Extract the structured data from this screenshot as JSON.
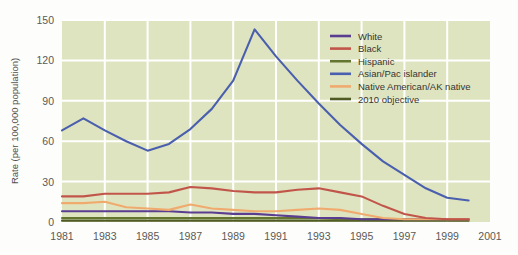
{
  "chart_data": {
    "type": "line",
    "title": "",
    "xlabel": "",
    "ylabel": "Rate (per 100,000 population)",
    "xlim": [
      1981,
      2001
    ],
    "ylim": [
      0,
      150
    ],
    "yticks": [
      0,
      30,
      60,
      90,
      120,
      150
    ],
    "ytick_labels": [
      "0",
      "30",
      "60",
      "90",
      "120",
      "150"
    ],
    "xticks": [
      1981,
      1983,
      1985,
      1987,
      1989,
      1991,
      1993,
      1995,
      1997,
      1999,
      2001
    ],
    "xtick_labels": [
      "1981",
      "1983",
      "1985",
      "1987",
      "1989",
      "1991",
      "1993",
      "1995",
      "1997",
      "1999",
      "2001"
    ],
    "grid": true,
    "grid_color": "#ffffff",
    "plot_bgcolor": "#dfe4c0",
    "legend_position": "upper right",
    "x": [
      1981,
      1982,
      1983,
      1984,
      1985,
      1986,
      1987,
      1988,
      1989,
      1990,
      1991,
      1992,
      1993,
      1994,
      1995,
      1996,
      1997,
      1998,
      1999,
      2000
    ],
    "series": [
      {
        "name": "White",
        "color": "#5a3d91",
        "values": [
          8,
          8,
          8,
          8,
          8,
          8,
          7,
          7,
          6,
          6,
          5,
          4,
          3,
          3,
          2,
          2,
          2,
          2,
          2,
          2
        ]
      },
      {
        "name": "Black",
        "color": "#c1554a",
        "values": [
          19,
          19,
          21,
          21,
          21,
          22,
          26,
          25,
          23,
          22,
          22,
          24,
          25,
          22,
          19,
          12,
          6,
          3,
          2,
          2
        ]
      },
      {
        "name": "Hispanic",
        "color": "#63752f",
        "values": [
          3,
          3,
          3,
          3,
          3,
          3,
          3,
          3,
          3,
          3,
          3,
          3,
          3,
          2,
          2,
          2,
          2,
          2,
          2,
          2
        ]
      },
      {
        "name": "Asian/Pac islander",
        "color": "#4a5fae",
        "values": [
          68,
          77,
          68,
          60,
          53,
          58,
          69,
          84,
          105,
          143,
          123,
          105,
          88,
          72,
          58,
          45,
          35,
          25,
          18,
          16
        ]
      },
      {
        "name": "Native American/AK native",
        "color": "#f0aa6e",
        "values": [
          14,
          14,
          15,
          11,
          10,
          9,
          13,
          10,
          9,
          8,
          8,
          9,
          10,
          9,
          6,
          3,
          2,
          2,
          2,
          2
        ]
      },
      {
        "name": "2010 objective",
        "color": "#4f5a24",
        "values": [
          1,
          1,
          1,
          1,
          1,
          1,
          1,
          1,
          1,
          1,
          1,
          1,
          1,
          1,
          1,
          1,
          1,
          1,
          1,
          1
        ]
      }
    ]
  },
  "axis": {
    "ylabel": "Rate (per 100,000 population)"
  },
  "legend": {
    "items": [
      {
        "label": "White",
        "color": "#5a3d91"
      },
      {
        "label": "Black",
        "color": "#c1554a"
      },
      {
        "label": "Hispanic",
        "color": "#63752f"
      },
      {
        "label": "Asian/Pac islander",
        "color": "#4a5fae"
      },
      {
        "label": "Native American/AK native",
        "color": "#f0aa6e"
      },
      {
        "label": "2010 objective",
        "color": "#4f5a24"
      }
    ]
  }
}
